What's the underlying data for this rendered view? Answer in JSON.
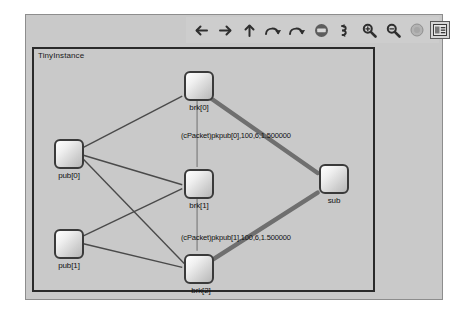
{
  "window": {
    "title": "TinyInstance Network View"
  },
  "toolbar": {
    "buttons": [
      {
        "name": "back-arrow-icon",
        "label": "Back",
        "glyph": "arrow-left"
      },
      {
        "name": "forward-arrow-icon",
        "label": "Forward",
        "glyph": "arrow-right"
      },
      {
        "name": "up-arrow-icon",
        "label": "Go to parent",
        "glyph": "arrow-up"
      },
      {
        "name": "step-icon",
        "label": "Step",
        "glyph": "curve-left"
      },
      {
        "name": "run-icon",
        "label": "Run",
        "glyph": "curve-right"
      },
      {
        "name": "stop-icon",
        "label": "Stop",
        "glyph": "stop-circle"
      },
      {
        "name": "rerun-icon",
        "label": "Run until",
        "glyph": "loop"
      },
      {
        "name": "zoom-in-icon",
        "label": "Zoom in",
        "glyph": "magnifier-plus"
      },
      {
        "name": "zoom-out-icon",
        "label": "Zoom out",
        "glyph": "magnifier-minus"
      },
      {
        "name": "relayout-icon",
        "label": "Re-layout",
        "glyph": "circle"
      },
      {
        "name": "labels-toggle-icon",
        "label": "Show labels",
        "glyph": "label-box"
      }
    ]
  },
  "canvas": {
    "module_title": "TinyInstance",
    "nodes": [
      {
        "id": "pub0",
        "label": "pub[0]",
        "x": 20,
        "y": 90
      },
      {
        "id": "pub1",
        "label": "pub[1]",
        "x": 20,
        "y": 180
      },
      {
        "id": "brk0",
        "label": "brk[0]",
        "x": 150,
        "y": 22
      },
      {
        "id": "brk1",
        "label": "brk[1]",
        "x": 150,
        "y": 120
      },
      {
        "id": "brk2",
        "label": "brk[2]",
        "x": 150,
        "y": 205
      },
      {
        "id": "sub",
        "label": "sub",
        "x": 285,
        "y": 115
      }
    ],
    "edges": [
      {
        "from": "pub0",
        "to": "brk0",
        "style": "thin"
      },
      {
        "from": "pub0",
        "to": "brk1",
        "style": "thin"
      },
      {
        "from": "pub0",
        "to": "brk2",
        "style": "thin"
      },
      {
        "from": "pub1",
        "to": "brk1",
        "style": "thin"
      },
      {
        "from": "pub1",
        "to": "brk2",
        "style": "thin"
      },
      {
        "from": "brk0",
        "to": "brk1",
        "style": "thin"
      },
      {
        "from": "brk1",
        "to": "brk2",
        "style": "thin"
      },
      {
        "from": "brk0",
        "to": "sub",
        "style": "thick"
      },
      {
        "from": "brk2",
        "to": "sub",
        "style": "thick"
      }
    ],
    "edge_labels": [
      {
        "id": "pkt-pub0",
        "text": "(cPacket)pkpub[0],100,6,1.500000",
        "x": 178,
        "y": 113
      },
      {
        "id": "pkt-pub1",
        "text": "(cPacket)pkpub[1],100,6,1.500000",
        "x": 178,
        "y": 215
      }
    ]
  },
  "colors": {
    "window_bg": "#c9c9c9",
    "frame_border": "#2a2a2a",
    "node_border": "#3a3a3a",
    "edge_thin": "#4a4a4a",
    "edge_thick": "#6a6a6a",
    "toolbar_bg": "#cdcdcd"
  }
}
